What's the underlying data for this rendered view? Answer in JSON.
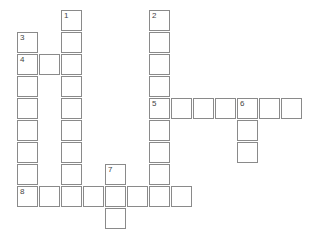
{
  "puzzle": {
    "type": "crossword",
    "cell_size": 22,
    "origin": {
      "x": 17,
      "y": 10
    },
    "cells": [
      {
        "col": 2,
        "row": 0,
        "num": "1"
      },
      {
        "col": 2,
        "row": 1
      },
      {
        "col": 2,
        "row": 2
      },
      {
        "col": 2,
        "row": 3
      },
      {
        "col": 2,
        "row": 4
      },
      {
        "col": 2,
        "row": 5
      },
      {
        "col": 2,
        "row": 6
      },
      {
        "col": 2,
        "row": 7
      },
      {
        "col": 2,
        "row": 8
      },
      {
        "col": 6,
        "row": 0,
        "num": "2"
      },
      {
        "col": 6,
        "row": 1
      },
      {
        "col": 6,
        "row": 2
      },
      {
        "col": 6,
        "row": 3
      },
      {
        "col": 6,
        "row": 4,
        "num": "5"
      },
      {
        "col": 6,
        "row": 5
      },
      {
        "col": 6,
        "row": 6
      },
      {
        "col": 6,
        "row": 7
      },
      {
        "col": 6,
        "row": 8
      },
      {
        "col": 0,
        "row": 1,
        "num": "3"
      },
      {
        "col": 0,
        "row": 2,
        "num": "4"
      },
      {
        "col": 0,
        "row": 3
      },
      {
        "col": 0,
        "row": 4
      },
      {
        "col": 0,
        "row": 5
      },
      {
        "col": 0,
        "row": 6
      },
      {
        "col": 0,
        "row": 7
      },
      {
        "col": 0,
        "row": 8,
        "num": "8"
      },
      {
        "col": 1,
        "row": 2
      },
      {
        "col": 7,
        "row": 4
      },
      {
        "col": 8,
        "row": 4
      },
      {
        "col": 9,
        "row": 4
      },
      {
        "col": 10,
        "row": 4,
        "num": "6"
      },
      {
        "col": 11,
        "row": 4
      },
      {
        "col": 12,
        "row": 4
      },
      {
        "col": 10,
        "row": 5
      },
      {
        "col": 10,
        "row": 6
      },
      {
        "col": 1,
        "row": 8
      },
      {
        "col": 3,
        "row": 8
      },
      {
        "col": 4,
        "row": 7,
        "num": "7"
      },
      {
        "col": 4,
        "row": 8
      },
      {
        "col": 4,
        "row": 9
      },
      {
        "col": 5,
        "row": 8
      },
      {
        "col": 7,
        "row": 8
      }
    ]
  }
}
